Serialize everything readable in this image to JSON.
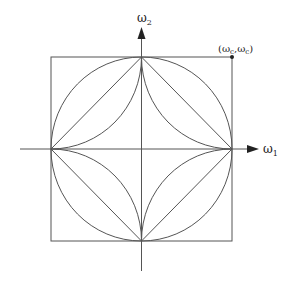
{
  "diagram": {
    "axes": {
      "x_label": "ω",
      "x_subscript": "1",
      "y_label": "ω",
      "y_subscript": "2"
    },
    "corner_point": {
      "label": "(ω",
      "sub1": "c",
      "mid": ",ω",
      "sub2": "c",
      "end": ")"
    },
    "shapes": [
      "square",
      "inscribed-circle",
      "diamond",
      "astroid"
    ],
    "colors": {
      "stroke": "#555555",
      "background": "#ffffff",
      "text": "#222222"
    }
  }
}
